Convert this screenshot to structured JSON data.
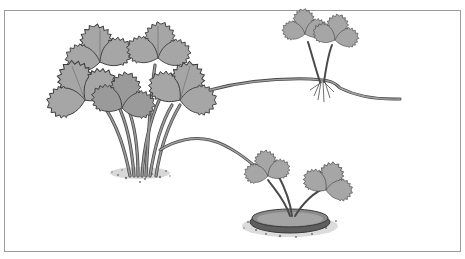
{
  "illustration": {
    "subject": "strawberry plant with runners",
    "parts": [
      {
        "id": "mother-plant",
        "description": "mature strawberry plant with trifoliate serrated leaves"
      },
      {
        "id": "runner-rooted-plantlet",
        "description": "runner leading to a rooted plantlet on the right"
      },
      {
        "id": "runner-potted-plantlet",
        "description": "runner leading to a plantlet pegged into a shallow pot"
      }
    ]
  },
  "colors": {
    "background": "#ffffff",
    "frame": "#9a9a9a",
    "leaf_fill": "#a8a8a8",
    "leaf_dark": "#7a7a7a",
    "leaf_edge": "#3c3c3c",
    "stem": "#8c8c8c",
    "stem_edge": "#4a4a4a",
    "soil": "#6f6f6f",
    "pot_rim": "#5a5a5a",
    "pot_fill": "#9e9e9e"
  }
}
